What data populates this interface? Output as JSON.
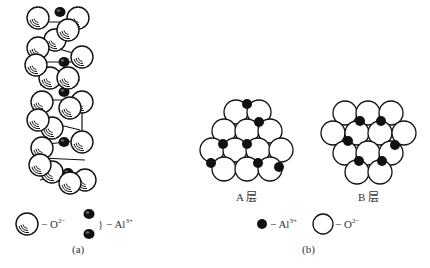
{
  "panel_a": {
    "caption": "(a)",
    "legend": {
      "oxygen_label": "O",
      "oxygen_charge": "2−",
      "oxygen_dash": "−",
      "aluminum_label": "Al",
      "aluminum_charge": "3+",
      "aluminum_dash": "} −"
    }
  },
  "panel_b": {
    "caption": "(b)",
    "layer_a_label": "A 层",
    "layer_b_label": "B 层",
    "legend": {
      "aluminum_label": "Al",
      "aluminum_charge": "3+",
      "aluminum_dash": "−",
      "oxygen_label": "O",
      "oxygen_charge": "2−",
      "oxygen_dash": "−"
    }
  },
  "colors": {
    "line": "#111111",
    "ion_fill": "#111111",
    "oxygen_fill": "#ffffff"
  }
}
